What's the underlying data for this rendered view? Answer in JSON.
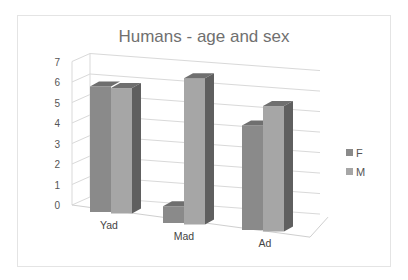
{
  "chart_data": {
    "type": "bar",
    "variant": "3d-clustered-column",
    "title": "Humans - age and sex",
    "xlabel": "",
    "ylabel": "",
    "categories": [
      "Yad",
      "Mad",
      "Ad"
    ],
    "series": [
      {
        "name": "F",
        "values": [
          6,
          0.8,
          5
        ],
        "color": "#8a8a8a"
      },
      {
        "name": "M",
        "values": [
          6,
          7,
          6
        ],
        "color": "#a6a6a6"
      }
    ],
    "ylim": [
      0,
      7
    ],
    "yticks": [
      "0",
      "1",
      "2",
      "3",
      "4",
      "5",
      "6",
      "7"
    ],
    "grid": true,
    "legend_position": "right"
  },
  "legend": {
    "items": [
      {
        "label": "F",
        "color": "#8a8a8a"
      },
      {
        "label": "M",
        "color": "#a6a6a6"
      }
    ]
  }
}
